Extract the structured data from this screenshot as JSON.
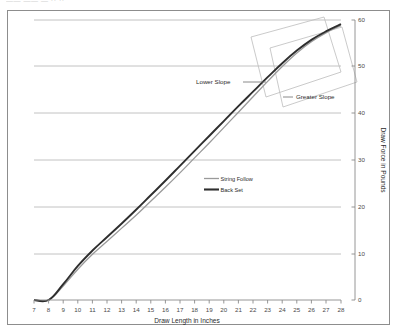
{
  "page": {
    "clipped_top_text": "—— —— — ··  ··",
    "background_color": "#ffffff",
    "frame_color": "#8d8d8d"
  },
  "chart_data": {
    "type": "line",
    "title": "",
    "subtitle": "",
    "xlabel": "Draw Length in Inches",
    "ylabel": "Draw Force in Pounds",
    "xlim": [
      7,
      28
    ],
    "ylim": [
      0,
      60
    ],
    "xticks": [
      7,
      8,
      9,
      10,
      11,
      12,
      13,
      14,
      15,
      16,
      17,
      18,
      19,
      20,
      21,
      22,
      23,
      24,
      25,
      26,
      27,
      28
    ],
    "yticks": [
      0,
      10,
      20,
      30,
      40,
      50,
      60
    ],
    "xtick_labels": [
      "7",
      "8",
      "9",
      "10",
      "11",
      "12",
      "13",
      "14",
      "15",
      "16",
      "17",
      "18",
      "19",
      "20",
      "21",
      "22",
      "23",
      "24",
      "25",
      "26",
      "27",
      "28"
    ],
    "ytick_labels": [
      "0",
      "10",
      "20",
      "30",
      "40",
      "50",
      "60"
    ],
    "grid": "horizontal",
    "y_axis_position": "right",
    "legend_position": "center",
    "x": [
      7,
      8,
      9,
      10,
      11,
      12,
      13,
      14,
      15,
      16,
      17,
      18,
      19,
      20,
      21,
      22,
      23,
      24,
      25,
      26,
      27,
      28
    ],
    "series": [
      {
        "name": "String Follow",
        "color": "#9a9a9a",
        "width": 1.3,
        "values": [
          0,
          0,
          3.0,
          6.6,
          9.8,
          12.6,
          15.4,
          18.2,
          21.2,
          24.2,
          27.3,
          30.5,
          33.7,
          37.0,
          40.3,
          43.6,
          46.9,
          50.1,
          53.0,
          55.4,
          57.3,
          58.8
        ]
      },
      {
        "name": "Back Set",
        "color": "#2e2e2e",
        "width": 1.9,
        "values": [
          0,
          0,
          3.4,
          7.3,
          10.6,
          13.5,
          16.4,
          19.4,
          22.5,
          25.6,
          28.8,
          32.0,
          35.2,
          38.4,
          41.6,
          44.7,
          47.8,
          50.8,
          53.5,
          55.8,
          57.6,
          59.1
        ]
      }
    ],
    "annotations": [
      {
        "text": "Lower Slope",
        "name": "lower-slope-annotation"
      },
      {
        "text": "Greater Slope",
        "name": "greater-slope-annotation"
      }
    ],
    "callout_boxes": [
      {
        "name": "lower-slope-callout-box"
      },
      {
        "name": "greater-slope-callout-box"
      }
    ]
  }
}
